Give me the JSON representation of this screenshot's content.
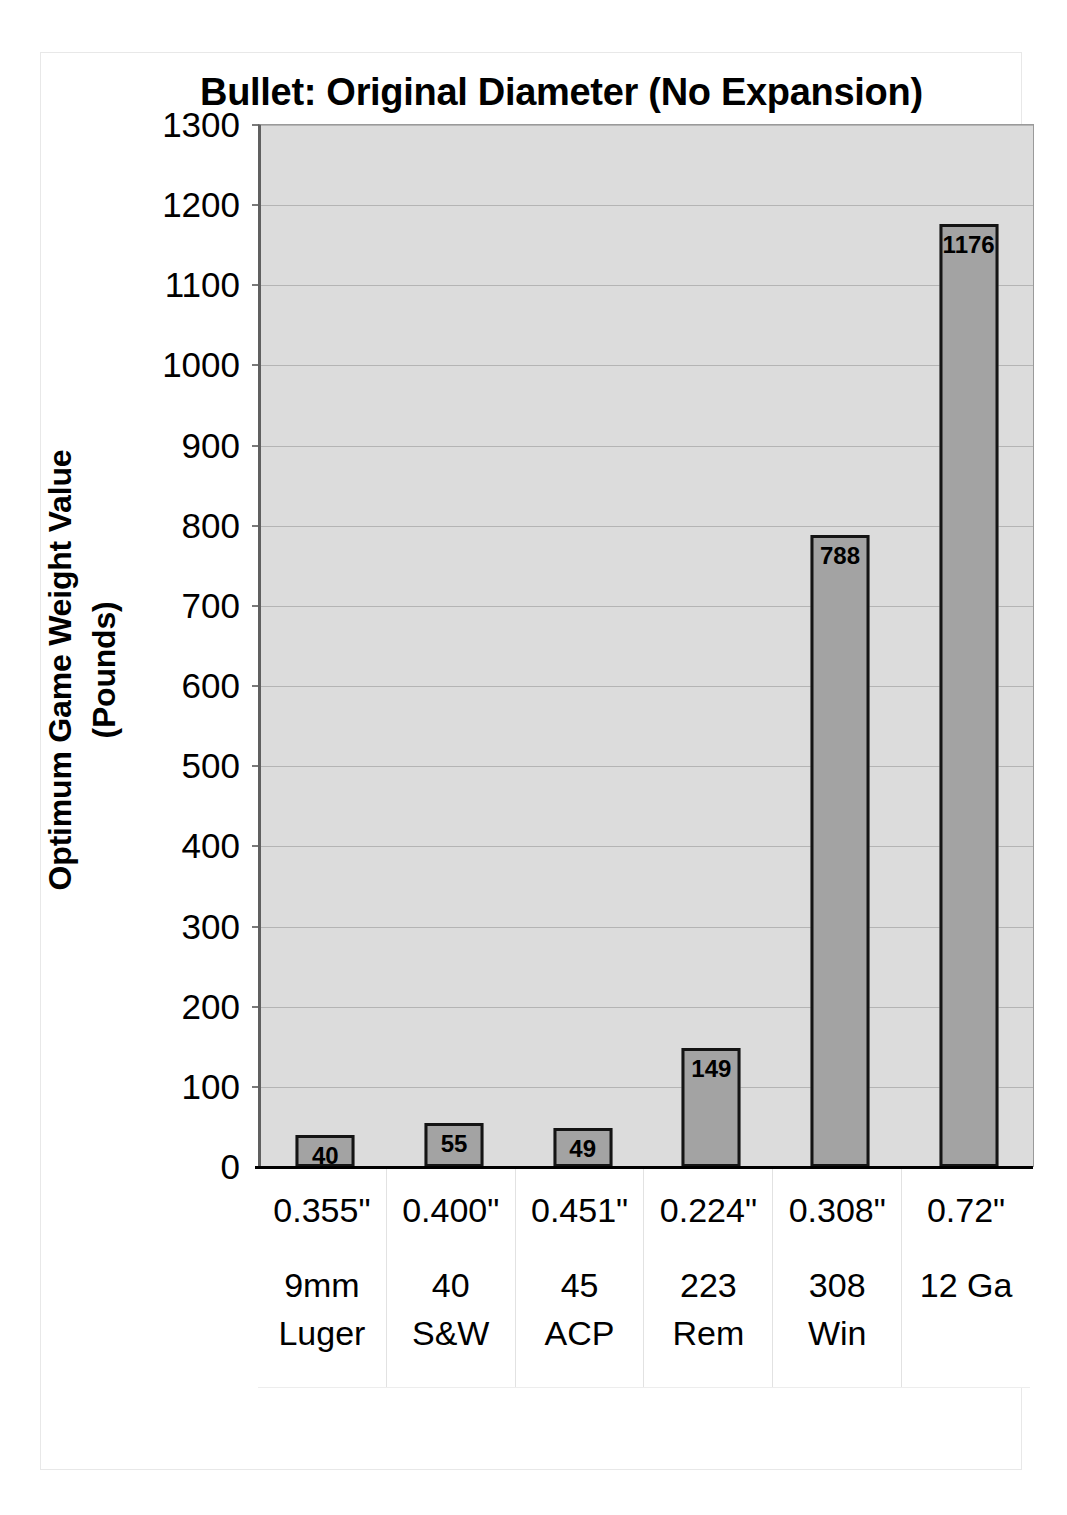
{
  "chart_data": {
    "type": "bar",
    "title": "Bullet:  Original Diameter (No Expansion)",
    "xlabel": "",
    "ylabel": "Optimum Game Weight Value (Pounds)",
    "ylabel_line1": "Optimum Game Weight Value",
    "ylabel_line2": "(Pounds)",
    "ylim": [
      0,
      1300
    ],
    "ytick_step": 100,
    "yticks": [
      "1300",
      "1200",
      "1100",
      "1000",
      "900",
      "800",
      "700",
      "600",
      "500",
      "400",
      "300",
      "200",
      "100",
      "0"
    ],
    "grid": true,
    "legend": "none",
    "categories": [
      "9mm Luger",
      "40 S&W",
      "45 ACP",
      "223 Rem",
      "308 Win",
      "12 Ga"
    ],
    "category_rows": [
      {
        "diameter": "0.355\"",
        "name_line1": "9mm",
        "name_line2": "Luger"
      },
      {
        "diameter": "0.400\"",
        "name_line1": "40",
        "name_line2": "S&W"
      },
      {
        "diameter": "0.451\"",
        "name_line1": "45",
        "name_line2": "ACP"
      },
      {
        "diameter": "0.224\"",
        "name_line1": "223",
        "name_line2": "Rem"
      },
      {
        "diameter": "0.308\"",
        "name_line1": "308",
        "name_line2": "Win"
      },
      {
        "diameter": "0.72\"",
        "name_line1": "12 Ga",
        "name_line2": ""
      }
    ],
    "values": [
      40,
      55,
      49,
      149,
      788,
      1176
    ],
    "value_labels": [
      "40",
      "55",
      "49",
      "149",
      "788",
      "1176"
    ],
    "colors": {
      "bar_fill": "#a3a3a3",
      "bar_border": "#141414",
      "plot_background": "#dcdcdc",
      "gridline": "#b4b4b4",
      "axis": "#000000",
      "text": "#000000"
    }
  }
}
